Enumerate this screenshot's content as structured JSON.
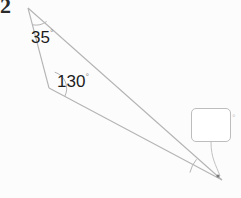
{
  "question": {
    "number": "2"
  },
  "figure": {
    "type": "triangle",
    "stroke_color": "#b4b4b4",
    "background_color": "#fcfcfc",
    "vertices": {
      "apex": {
        "x": 28,
        "y": 8
      },
      "middle_left": {
        "x": 49,
        "y": 88
      },
      "bottom_right": {
        "x": 222,
        "y": 180
      }
    },
    "angles": [
      {
        "name": "apex-angle",
        "value": "35",
        "degree_symbol": "°",
        "vertex": "apex"
      },
      {
        "name": "middle-angle",
        "value": "130",
        "degree_symbol": "°",
        "vertex": "middle_left"
      },
      {
        "name": "unknown-angle",
        "value": "",
        "degree_symbol": "°",
        "vertex": "bottom_right"
      }
    ]
  },
  "answer": {
    "value": "",
    "placeholder": "",
    "degree_symbol": "°"
  }
}
